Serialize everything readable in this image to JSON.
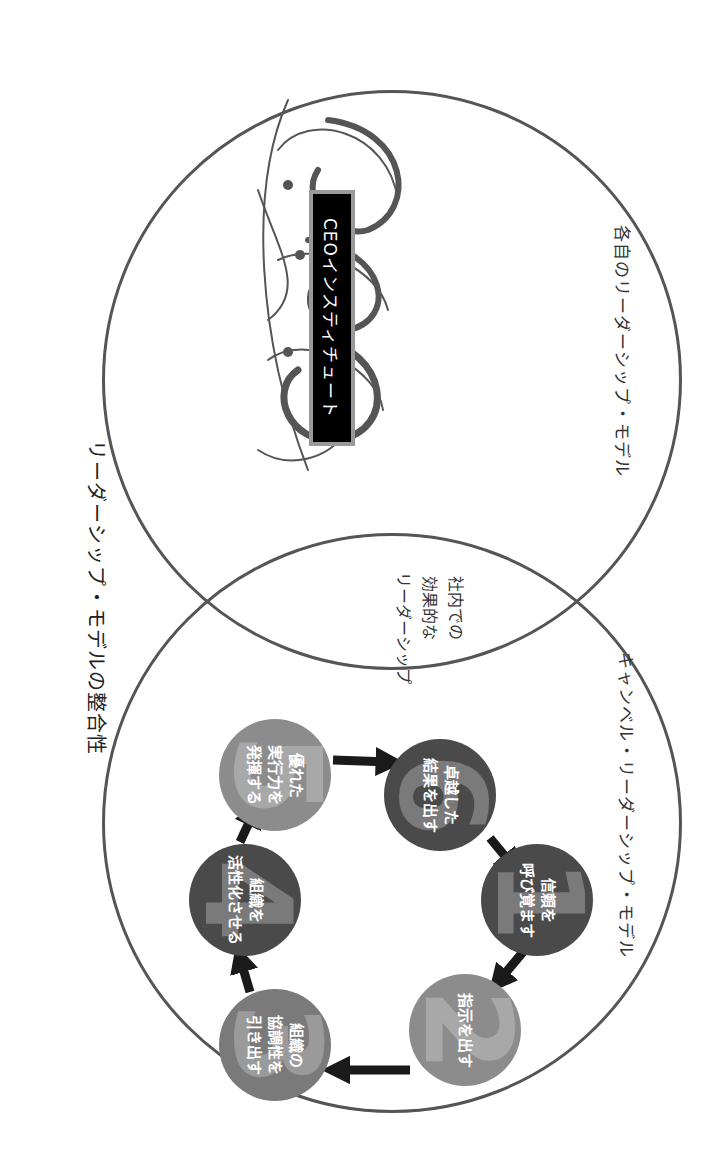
{
  "title": "リーダーシップ・モデルの整合性",
  "left_circle": {
    "label": "各自のリーダーシップ・モデル",
    "logo_name": "CEOインスティチュート"
  },
  "right_circle": {
    "label": "キャンベル・リーダーシップ・モデル"
  },
  "overlap": {
    "lines": [
      "社内での",
      "効果的な",
      "リーダーシップ"
    ]
  },
  "steps": [
    {
      "number": "1",
      "lines": [
        "信頼を",
        "呼び覚ます"
      ],
      "fill": "#4a4a4a",
      "numcolor": "#7a7a7a"
    },
    {
      "number": "2",
      "lines": [
        "指示を出す"
      ],
      "fill": "#8c8c8c",
      "numcolor": "#a8a8a8"
    },
    {
      "number": "3",
      "lines": [
        "組織の",
        "協調性を",
        "引き出す"
      ],
      "fill": "#7a7a7a",
      "numcolor": "#9a9a9a"
    },
    {
      "number": "4",
      "lines": [
        "組織を",
        "活性化させる"
      ],
      "fill": "#4a4a4a",
      "numcolor": "#7a7a7a"
    },
    {
      "number": "5",
      "lines": [
        "優れた",
        "実行力を",
        "発揮する"
      ],
      "fill": "#8c8c8c",
      "numcolor": "#a8a8a8"
    },
    {
      "number": "6",
      "lines": [
        "卓越した",
        "結果を出す"
      ],
      "fill": "#4a4a4a",
      "numcolor": "#7a7a7a"
    }
  ],
  "colors": {
    "outline": "#555555",
    "arrow": "#1a1a1a",
    "logo_box": "#000000",
    "logo_border": "#999999"
  }
}
